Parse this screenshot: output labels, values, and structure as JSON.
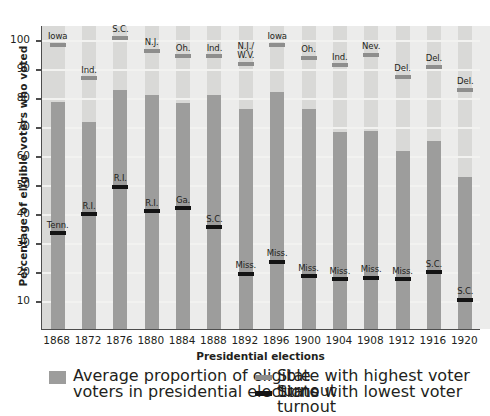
{
  "chart_data": {
    "type": "bar",
    "title": "",
    "xlabel": "Presidential elections",
    "ylabel": "Percentage of eligible voters who voted",
    "ylim": [
      0,
      105
    ],
    "yticks": [
      10,
      20,
      30,
      40,
      50,
      60,
      70,
      80,
      90,
      100
    ],
    "grid": true,
    "legend_position": "bottom",
    "categories": [
      "1868",
      "1872",
      "1876",
      "1880",
      "1884",
      "1888",
      "1892",
      "1896",
      "1900",
      "1904",
      "1908",
      "1912",
      "1916",
      "1920"
    ],
    "series": [
      {
        "name": "Average proportion of eligible voters in presidential elections",
        "type": "bar",
        "color": "#9d9d9c",
        "values": [
          78.5,
          71.5,
          82.5,
          81.0,
          78.0,
          81.0,
          76.0,
          82.0,
          76.0,
          68.0,
          68.5,
          61.5,
          65.0,
          52.5
        ]
      },
      {
        "name": "State with highest voter turnout",
        "type": "marker",
        "color": "#8e8e8d",
        "values": [
          98.5,
          87.0,
          101.0,
          96.5,
          94.5,
          94.5,
          92.0,
          98.5,
          94.0,
          91.5,
          95.0,
          87.5,
          91.0,
          83.0
        ],
        "labels": [
          "Iowa",
          "Ind.",
          "S.C.",
          "N.J.",
          "Oh.",
          "Ind.",
          "N.J./\nW.V.",
          "Iowa",
          "Oh.",
          "Ind.",
          "Nev.",
          "Del.",
          "Del.",
          "Del."
        ]
      },
      {
        "name": "State with lowest voter turnout",
        "type": "marker",
        "color": "#141414",
        "values": [
          33.5,
          40.0,
          49.5,
          41.0,
          42.0,
          35.5,
          19.5,
          23.5,
          18.5,
          17.5,
          18.0,
          17.5,
          20.0,
          10.5
        ],
        "labels": [
          "Tenn.",
          "R.I.",
          "R.I.",
          "R.I.",
          "Ga.",
          "S.C.",
          "Miss.",
          "Miss.",
          "Miss.",
          "Miss.",
          "Miss.",
          "Miss.",
          "S.C.",
          "S.C."
        ]
      }
    ]
  },
  "legend": {
    "bar_label_line1": "Average proportion of eligible",
    "bar_label_line2": "voters in presidential elections",
    "high_label": "State with highest voter turnout",
    "low_label": "State with lowest voter turnout"
  },
  "colors": {
    "plot_background": "#d9d9d7",
    "column_band": "#ececeb",
    "gridline": "#f2f2f0",
    "bar": "#9d9d9c",
    "high_marker": "#8e8e8d",
    "low_marker": "#141414",
    "axis": "#4d4d4d",
    "text": "#231f20"
  }
}
